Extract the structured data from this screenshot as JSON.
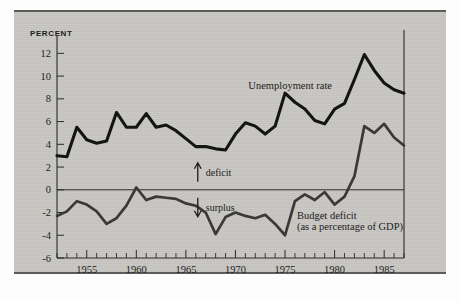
{
  "figure": {
    "unit_label": "PERCENT",
    "background_color": "#c9c8c4",
    "ink_color": "#141414"
  },
  "annotations": {
    "deficit_label": "deficit",
    "surplus_label": "surplus",
    "unemployment_label": "Unemployment rate",
    "budget_label_line1": "Budget deficit",
    "budget_label_line2": "(as a percentage of GDP)"
  },
  "chart_data": {
    "type": "line",
    "title": "",
    "xlabel": "",
    "ylabel": "PERCENT",
    "xlim": [
      1952,
      1987
    ],
    "ylim": [
      -6,
      13
    ],
    "yticks": [
      12,
      10,
      8,
      6,
      4,
      2,
      0,
      -2,
      -4,
      -6
    ],
    "ytick_labels": [
      "12",
      "10",
      "8",
      "6",
      "4",
      "2",
      "0",
      "-2",
      "-4",
      "-6"
    ],
    "xticks": [
      1955,
      1960,
      1965,
      1970,
      1975,
      1980,
      1985
    ],
    "xtick_labels": [
      "1955",
      "1960",
      "1965",
      "1970",
      "1975",
      "1980",
      "1985"
    ],
    "xtick_minor_step": 1,
    "grid": false,
    "legend": "inline-annotation",
    "zero_line": 0,
    "x": [
      1952,
      1953,
      1954,
      1955,
      1956,
      1957,
      1958,
      1959,
      1960,
      1961,
      1962,
      1963,
      1964,
      1965,
      1966,
      1967,
      1968,
      1969,
      1970,
      1971,
      1972,
      1973,
      1974,
      1975,
      1976,
      1977,
      1978,
      1979,
      1980,
      1981,
      1982,
      1983,
      1984,
      1985,
      1986,
      1987
    ],
    "series": [
      {
        "name": "Unemployment rate",
        "color": "#141414",
        "values": [
          3.0,
          2.9,
          5.5,
          4.4,
          4.1,
          4.3,
          6.8,
          5.5,
          5.5,
          6.7,
          5.5,
          5.7,
          5.2,
          4.5,
          3.8,
          3.8,
          3.6,
          3.5,
          4.9,
          5.9,
          5.6,
          4.9,
          5.6,
          8.5,
          7.7,
          7.1,
          6.1,
          5.8,
          7.1,
          7.6,
          9.7,
          11.9,
          10.5,
          9.4,
          8.8,
          8.5
        ]
      },
      {
        "name": "Budget deficit (as a percentage of GDP)",
        "color": "#3a3936",
        "values": [
          -2.3,
          -1.9,
          -1.0,
          -1.3,
          -1.9,
          -3.0,
          -2.5,
          -1.4,
          0.2,
          -0.9,
          -0.6,
          -0.7,
          -0.8,
          -1.2,
          -1.4,
          -2.0,
          -3.9,
          -2.4,
          -2.0,
          -2.3,
          -2.5,
          -2.2,
          -3.0,
          -4.0,
          -1.0,
          -0.4,
          -0.9,
          -0.2,
          -1.3,
          -0.6,
          1.2,
          5.6,
          5.0,
          5.8,
          4.6,
          3.9
        ]
      }
    ],
    "annotations": [
      {
        "text": "deficit",
        "direction": "up",
        "meaning": "above zero line"
      },
      {
        "text": "surplus",
        "direction": "down",
        "meaning": "below zero line"
      }
    ]
  }
}
